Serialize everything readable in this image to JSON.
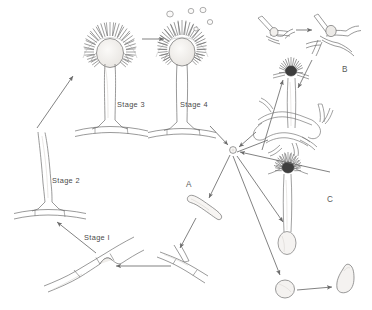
{
  "figure": {
    "background_color": "#ffffff",
    "ink_color": "#5a5a5a",
    "fill_color": "#f2f0ee",
    "width": 372,
    "height": 310
  },
  "stage_labels": {
    "stage1": "Stage I",
    "stage2": "Stage 2",
    "stage3": "Stage 3",
    "stage4": "Stage 4"
  },
  "section_labels": {
    "a": "A",
    "b": "B",
    "c": "C"
  },
  "structures": [
    {
      "id": "foot-cell-hypha",
      "name": "foot cell on hypha",
      "stage": "Stage I",
      "x": 95,
      "y": 270
    },
    {
      "id": "bare-conidiophore",
      "name": "conidiophore stalk",
      "stage": "Stage 2",
      "x": 62,
      "y": 175
    },
    {
      "id": "vesicle-conidiophore",
      "name": "conidiophore with vesicle",
      "stage": "Stage 3",
      "x": 110,
      "y": 60
    },
    {
      "id": "sporulating-head",
      "name": "sporulating conidial head",
      "stage": "Stage 4",
      "x": 182,
      "y": 55
    },
    {
      "id": "free-conidia",
      "name": "released conidia",
      "stage": "Stage 4",
      "x": 195,
      "y": 15
    },
    {
      "id": "central-spore-hub",
      "name": "central conidium hub",
      "stage": "",
      "x": 233,
      "y": 150
    },
    {
      "id": "germinating-spore-a",
      "name": "germinating conidium",
      "stage": "A",
      "x": 205,
      "y": 205
    },
    {
      "id": "branched-hypha-bottom",
      "name": "branching hypha",
      "stage": "",
      "x": 200,
      "y": 265
    },
    {
      "id": "sclerotium-young",
      "name": "young sclerotium initial",
      "stage": "B",
      "x": 278,
      "y": 30
    },
    {
      "id": "sclerotium-mature",
      "name": "mature sclerotium",
      "stage": "B",
      "x": 330,
      "y": 33
    },
    {
      "id": "cleistothecium-head",
      "name": "conidial head on mycelium mat",
      "stage": "",
      "x": 292,
      "y": 75
    },
    {
      "id": "mycelial-mat",
      "name": "mycelial network",
      "stage": "",
      "x": 296,
      "y": 125
    },
    {
      "id": "conidiophore-c",
      "name": "conidiophore",
      "stage": "C",
      "x": 288,
      "y": 185
    },
    {
      "id": "round-conidium",
      "name": "conidium",
      "stage": "C",
      "x": 285,
      "y": 285
    },
    {
      "id": "germ-tube-spore",
      "name": "conidium with germ tube",
      "stage": "C",
      "x": 345,
      "y": 278
    }
  ],
  "arrows": [
    {
      "id": "arrow-stage3-to-stage4",
      "from": "vesicle-conidiophore",
      "to": "sporulating-head"
    },
    {
      "id": "arrow-stage1-to-stage2",
      "from": "foot-cell-hypha",
      "to": "bare-conidiophore"
    },
    {
      "id": "arrow-stage2-to-stage3",
      "from": "bare-conidiophore",
      "to": "vesicle-conidiophore"
    },
    {
      "id": "arrow-hypha-to-foot",
      "from": "branched-hypha-bottom",
      "to": "foot-cell-hypha"
    },
    {
      "id": "arrow-hub-to-germ-a",
      "from": "central-spore-hub",
      "to": "germinating-spore-a"
    },
    {
      "id": "arrow-germ-a-to-hypha",
      "from": "germinating-spore-a",
      "to": "branched-hypha-bottom"
    },
    {
      "id": "arrow-stage4-to-hub",
      "from": "sporulating-head",
      "to": "central-spore-hub"
    },
    {
      "id": "arrow-scler-to-hub",
      "from": "sclerotium-mature",
      "to": "central-spore-hub"
    },
    {
      "id": "arrow-hub-to-head-c",
      "from": "central-spore-hub",
      "to": "conidiophore-c"
    },
    {
      "id": "arrow-hub-to-conidium",
      "from": "central-spore-hub",
      "to": "round-conidium"
    },
    {
      "id": "arrow-germtube-to-hub",
      "from": "germ-tube-spore",
      "to": "central-spore-hub"
    },
    {
      "id": "arrow-conid-to-germ",
      "from": "round-conidium",
      "to": "germ-tube-spore"
    },
    {
      "id": "arrow-young-to-mature",
      "from": "sclerotium-young",
      "to": "sclerotium-mature"
    },
    {
      "id": "arrow-mat-to-hub",
      "from": "mycelial-mat",
      "to": "central-spore-hub"
    },
    {
      "id": "arrow-mat-to-head",
      "from": "mycelial-mat",
      "to": "cleistothecium-head"
    }
  ]
}
